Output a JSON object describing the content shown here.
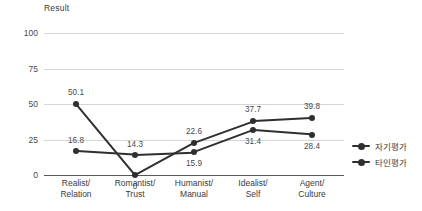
{
  "chart_data": {
    "type": "line",
    "title": "Result",
    "xlabel": "",
    "ylabel": "",
    "ylim": [
      0,
      100
    ],
    "yticks": [
      "0",
      "25",
      "50",
      "75",
      "100"
    ],
    "grid": true,
    "legend_position": "right",
    "categories": [
      {
        "line1": "Realist/",
        "line2": "Relation"
      },
      {
        "line1": "Romantist/",
        "line2": "Trust"
      },
      {
        "line1": "Humanist/",
        "line2": "Manual"
      },
      {
        "line1": "Idealist/",
        "line2": "Self"
      },
      {
        "line1": "Agent/",
        "line2": "Culture"
      }
    ],
    "series": [
      {
        "name": "자기평가",
        "values": [
          16.8,
          14.3,
          15.9,
          31.4,
          28.4
        ],
        "labels": [
          "16.8",
          "14.3",
          "15.9",
          "31.4",
          "28.4"
        ]
      },
      {
        "name": "타인평가",
        "values": [
          50.1,
          0,
          22.6,
          37.7,
          39.8
        ],
        "labels": [
          "50.1",
          "0",
          "22.6",
          "37.7",
          "39.8"
        ]
      }
    ],
    "colors": {
      "series_line": "#2f2f2f",
      "gridline": "#d6d6d6",
      "axis": "#595959",
      "text": "#3a3a3a"
    }
  }
}
